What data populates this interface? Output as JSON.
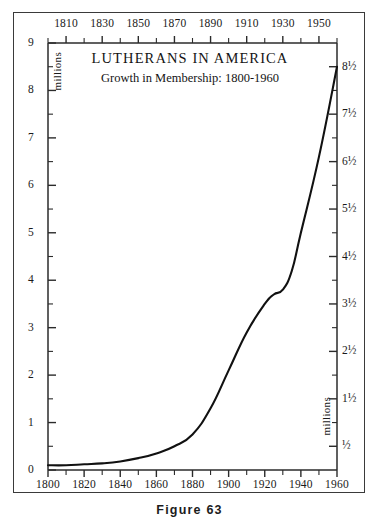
{
  "figure": {
    "caption": "Figure 63"
  },
  "chart_data": {
    "type": "line",
    "title": "LUTHERANS IN AMERICA",
    "subtitle": "Growth in Membership: 1800-1960",
    "xlabel": "",
    "ylabel": "millions",
    "y_unit_label_left": "millions",
    "y_unit_label_right": "millions",
    "xlim": [
      1800,
      1960
    ],
    "ylim": [
      0,
      9
    ],
    "grid": false,
    "legend": null,
    "x_axis_bottom_ticks": [
      1800,
      1810,
      1820,
      1830,
      1840,
      1850,
      1860,
      1870,
      1880,
      1890,
      1900,
      1910,
      1920,
      1930,
      1940,
      1950,
      1960
    ],
    "x_axis_bottom_labels": [
      "1800",
      "1820",
      "1840",
      "1860",
      "1880",
      "1900",
      "1920",
      "1940",
      "1960"
    ],
    "x_axis_bottom_label_values": [
      1800,
      1820,
      1840,
      1860,
      1880,
      1900,
      1920,
      1940,
      1960
    ],
    "x_axis_top_ticks": [
      1800,
      1810,
      1820,
      1830,
      1840,
      1850,
      1860,
      1870,
      1880,
      1890,
      1900,
      1910,
      1920,
      1930,
      1940,
      1950,
      1960
    ],
    "x_axis_top_labels": [
      "1810",
      "1830",
      "1850",
      "1870",
      "1890",
      "1910",
      "1930",
      "1950"
    ],
    "x_axis_top_label_values": [
      1810,
      1830,
      1850,
      1870,
      1890,
      1910,
      1930,
      1950
    ],
    "y_axis_left_major_values": [
      0,
      1,
      2,
      3,
      4,
      5,
      6,
      7,
      8,
      9
    ],
    "y_axis_left_labels": [
      "0",
      "1",
      "2",
      "3",
      "4",
      "5",
      "6",
      "7",
      "8",
      "9"
    ],
    "y_axis_left_minor_values": [
      0.5,
      1.5,
      2.5,
      3.5,
      4.5,
      5.5,
      6.5,
      7.5,
      8.5
    ],
    "y_axis_right_major_values": [
      0.5,
      1.5,
      2.5,
      3.5,
      4.5,
      5.5,
      6.5,
      7.5,
      8.5
    ],
    "y_axis_right_labels": [
      "½",
      "1½",
      "2½",
      "3½",
      "4½",
      "5½",
      "6½",
      "7½",
      "8½"
    ],
    "y_axis_right_minor_values": [
      1,
      2,
      3,
      4,
      5,
      6,
      7,
      8
    ],
    "x": [
      1800,
      1810,
      1820,
      1830,
      1840,
      1850,
      1860,
      1870,
      1880,
      1890,
      1900,
      1910,
      1920,
      1925,
      1930,
      1935,
      1940,
      1950,
      1960
    ],
    "values": [
      0.1,
      0.1,
      0.12,
      0.14,
      0.18,
      0.25,
      0.35,
      0.5,
      0.75,
      1.3,
      2.1,
      2.9,
      3.5,
      3.7,
      3.8,
      4.2,
      5.0,
      6.6,
      8.5
    ],
    "series": [
      {
        "name": "Lutheran membership in America",
        "unit": "millions",
        "color": "#111111",
        "values": [
          0.1,
          0.1,
          0.12,
          0.14,
          0.18,
          0.25,
          0.35,
          0.5,
          0.75,
          1.3,
          2.1,
          2.9,
          3.5,
          3.7,
          3.8,
          4.2,
          5.0,
          6.6,
          8.5
        ]
      }
    ]
  },
  "colors": {
    "curve": "#111111",
    "axis": "#2b2b2b",
    "border": "#3a3a3a",
    "text": "#1a1a1a",
    "background": "#ffffff"
  }
}
